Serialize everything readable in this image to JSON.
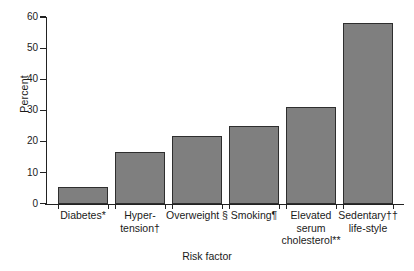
{
  "chart_data": {
    "type": "bar",
    "title": "",
    "xlabel": "Risk factor",
    "ylabel": "Percent",
    "ylim": [
      0,
      60
    ],
    "yticks": [
      0,
      10,
      20,
      30,
      40,
      50,
      60
    ],
    "ytick_labels": [
      "0",
      "10",
      "20",
      "30",
      "40",
      "50",
      "60"
    ],
    "grid": false,
    "legend": "none",
    "bar_color": "#7f7f7f",
    "bar_edge_color": "#2e2e2e",
    "axis_color": "#222222",
    "categories": [
      "Diabetes*",
      "Hyper-\ntension†",
      "Overweight §",
      "Smoking¶",
      "Elevated\nserum\ncholesterol**",
      "Sedentary††\nlife-style"
    ],
    "category_plain": [
      "Diabetes",
      "Hypertension",
      "Overweight",
      "Smoking",
      "Elevated serum cholesterol",
      "Sedentary life-style"
    ],
    "footnote_markers": [
      "*",
      "†",
      "§",
      "¶",
      "**",
      "††"
    ],
    "values": [
      5.5,
      16.8,
      22.0,
      25.0,
      31.2,
      58.2
    ]
  },
  "bars": [
    {
      "label": "Diabetes*",
      "value": 5.5,
      "left": 12,
      "width": 50,
      "center": 37
    },
    {
      "label": "Hyper-\ntension†",
      "value": 16.8,
      "left": 69,
      "width": 50,
      "center": 94
    },
    {
      "label": "Overweight §",
      "value": 22.0,
      "left": 126,
      "width": 50,
      "center": 151
    },
    {
      "label": "Smoking¶",
      "value": 25.0,
      "left": 183,
      "width": 50,
      "center": 208
    },
    {
      "label": "Elevated\nserum\ncholesterol**",
      "value": 31.2,
      "left": 240,
      "width": 50,
      "center": 265
    },
    {
      "label": "Sedentary††\nlife-style",
      "value": 58.2,
      "left": 297,
      "width": 50,
      "center": 322
    }
  ]
}
